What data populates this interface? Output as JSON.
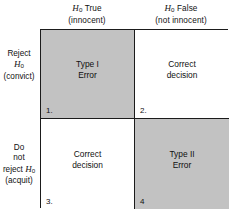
{
  "figure": {
    "colors": {
      "shaded_cell": "#c2c2c2",
      "plain_cell": "#ffffff",
      "border": "#1b1b1b",
      "text": "#111111"
    }
  },
  "columns": [
    {
      "line1_prefix": "H",
      "line1_sub": "0",
      "line1_suffix": " True",
      "line2": "(innocent)"
    },
    {
      "line1_prefix": "H",
      "line1_sub": "0",
      "line1_suffix": " False",
      "line2": "(not innocent)"
    }
  ],
  "rows": [
    {
      "line1": "Reject",
      "line2_prefix": "H",
      "line2_sub": "0",
      "line3": "(convict)"
    },
    {
      "line1": "Do",
      "line2": "not",
      "line3_prefix": "reject ",
      "line3_var": "H",
      "line3_sub": "0",
      "line4": "(acquit)"
    }
  ],
  "cells": [
    {
      "number": "1.",
      "line1": "Type I",
      "line2": "Error",
      "shaded": true
    },
    {
      "number": "2.",
      "line1": "Correct",
      "line2": "decision",
      "shaded": false
    },
    {
      "number": "3.",
      "line1": "Correct",
      "line2": "decision",
      "shaded": false
    },
    {
      "number": "4",
      "line1": "Type II",
      "line2": "Error",
      "shaded": true
    }
  ]
}
